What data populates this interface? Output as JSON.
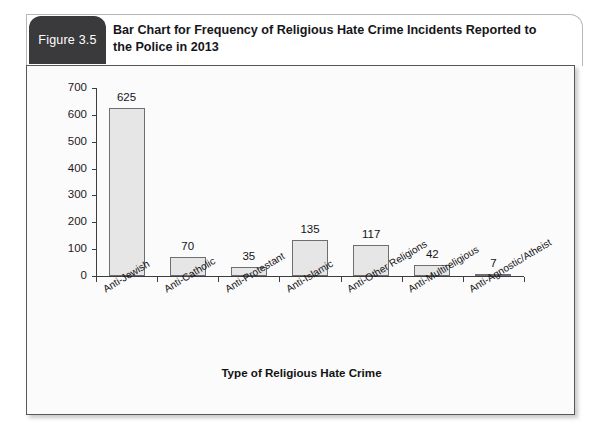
{
  "figure": {
    "tab_label": "Figure 3.5",
    "title": "Bar Chart for Frequency of Religious Hate Crime Incidents Reported to the Police in 2013"
  },
  "colors": {
    "tab_background": "#3a3a3c",
    "bar_fill": "#e6e6e6",
    "bar_border": "#6e6e70",
    "axis": "#3d3d3f",
    "card_border": "#58585a"
  },
  "chart_data": {
    "type": "bar",
    "title": "Bar Chart for Frequency of Religious Hate Crime Incidents Reported to the Police in 2013",
    "xlabel": "Type of Religious Hate Crime",
    "ylabel": "",
    "ylim": [
      0,
      700
    ],
    "ytick_step": 100,
    "yticks": [
      0,
      100,
      200,
      300,
      400,
      500,
      600,
      700
    ],
    "ytick_labels": [
      "0",
      "100",
      "200",
      "300",
      "400",
      "500",
      "600",
      "700"
    ],
    "grid": false,
    "legend": false,
    "value_labels": true,
    "categories": [
      "Anti-Jewish",
      "Anti-Catholic",
      "Anti-Protestant",
      "Anti-Islamic",
      "Anti-Other Religions",
      "Anti-Multireligious",
      "Anti-Agnostic/Atheist"
    ],
    "values": [
      625,
      70,
      35,
      135,
      117,
      42,
      7
    ],
    "value_label_texts": [
      "625",
      "70",
      "35",
      "135",
      "117",
      "42",
      "7"
    ]
  }
}
